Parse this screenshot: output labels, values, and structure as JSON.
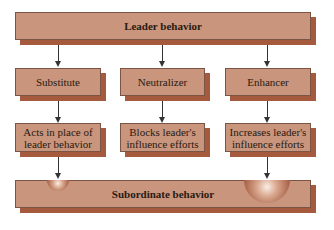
{
  "diagram": {
    "top": {
      "label": "Leader behavior"
    },
    "types": [
      {
        "label": "Substitute",
        "effect": "Acts in place of leader behavior",
        "effect_lines": [
          "Acts in place of",
          "leader behavior"
        ]
      },
      {
        "label": "Neutralizer",
        "effect": "Blocks leader's influence efforts",
        "effect_lines": [
          "Blocks leader's",
          "influence efforts"
        ]
      },
      {
        "label": "Enhancer",
        "effect": "Increases leader's influence efforts",
        "effect_lines": [
          "Increases leader's",
          "influence efforts"
        ]
      }
    ],
    "bottom": {
      "label": "Subordinate behavior"
    },
    "colors": {
      "box_fill": "#c9957c",
      "box_shadow": "#a55a3e",
      "box_border": "#7a5444",
      "arrow": "#333333"
    }
  }
}
